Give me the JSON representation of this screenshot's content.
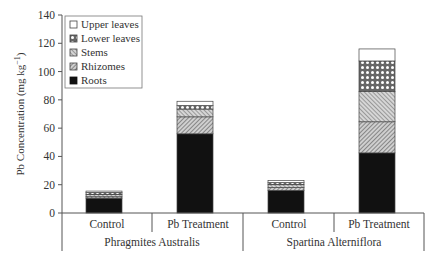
{
  "chart_data": {
    "type": "bar",
    "stacked": true,
    "title": "",
    "xlabel": "",
    "ylabel": "Pb Concentration (mg kg⁻¹)",
    "ylim": [
      0,
      140
    ],
    "yticks": [
      0,
      20,
      40,
      60,
      80,
      100,
      120,
      140
    ],
    "grid": false,
    "legend_position": "upper left (inside)",
    "groups": [
      "Phragmites Australis",
      "Spartina Alterniflora"
    ],
    "categories": [
      "Control",
      "Pb Treatment",
      "Control",
      "Pb Treatment"
    ],
    "category_groups": [
      "Phragmites Australis",
      "Phragmites Australis",
      "Spartina Alterniflora",
      "Spartina Alterniflora"
    ],
    "series": [
      {
        "name": "Roots",
        "pattern": "solid-black",
        "values": [
          10.5,
          56,
          16,
          42.5
        ]
      },
      {
        "name": "Rhizomes",
        "pattern": "diagonal-hatch-dense",
        "values": [
          1,
          12,
          2,
          22
        ]
      },
      {
        "name": "Stems",
        "pattern": "diagonal-hatch",
        "values": [
          1.5,
          5.5,
          2,
          21.5
        ]
      },
      {
        "name": "Lower leaves",
        "pattern": "dots",
        "values": [
          1.5,
          2.5,
          1.5,
          21.5
        ]
      },
      {
        "name": "Upper leaves",
        "pattern": "white",
        "values": [
          1,
          3,
          1.5,
          8.5
        ]
      }
    ],
    "totals": [
      15.5,
      79,
      23,
      116
    ]
  },
  "axis": {
    "ylabel_main": "Pb Concentration (mg kg",
    "ylabel_sup": "−1",
    "ylabel_close": ")",
    "ticks": [
      "0",
      "20",
      "40",
      "60",
      "80",
      "100",
      "120",
      "140"
    ]
  },
  "legend": {
    "items": [
      "Upper leaves",
      "Lower leaves",
      "Stems",
      "Rhizomes",
      "Roots"
    ]
  },
  "xaxis": {
    "categories": [
      "Control",
      "Pb Treatment",
      "Control",
      "Pb Treatment"
    ],
    "groups": [
      "Phragmites Australis",
      "Spartina Alterniflora"
    ]
  }
}
